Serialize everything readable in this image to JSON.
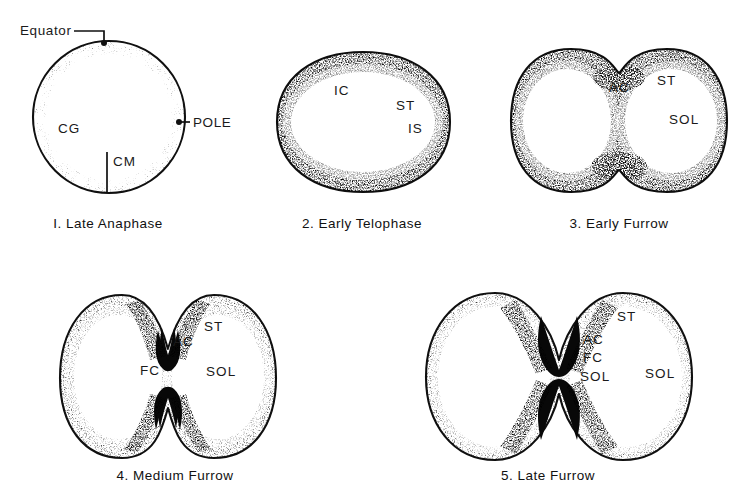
{
  "figure": {
    "background_color": "#ffffff",
    "ink_color": "#101010",
    "stipple_color": "#1a1a1a",
    "panel_count": 5
  },
  "panels": [
    {
      "id": "panel-1",
      "number": "I.",
      "caption": "I. Late  Anaphase",
      "caption_x": 108,
      "caption_y": 228,
      "shape": "circle",
      "labels": [
        {
          "name": "cg",
          "text": "CG",
          "x": 58,
          "y": 133
        },
        {
          "name": "cm",
          "text": "CM",
          "x": 113,
          "y": 166
        }
      ],
      "callouts": [
        {
          "name": "equator",
          "text": "Equator",
          "x": 20,
          "y": 35
        },
        {
          "name": "pole",
          "text": "POLE",
          "x": 193,
          "y": 127
        }
      ]
    },
    {
      "id": "panel-2",
      "number": "2.",
      "caption": "2. Early  Telophase",
      "caption_x": 362,
      "caption_y": 228,
      "shape": "rounded-oval",
      "labels": [
        {
          "name": "ic",
          "text": "IC",
          "x": 334,
          "y": 95
        },
        {
          "name": "st",
          "text": "ST",
          "x": 396,
          "y": 110
        },
        {
          "name": "is",
          "text": "IS",
          "x": 408,
          "y": 133
        }
      ],
      "callouts": []
    },
    {
      "id": "panel-3",
      "number": "3.",
      "caption": "3. Early  Furrow",
      "caption_x": 619,
      "caption_y": 228,
      "shape": "early-furrow",
      "labels": [
        {
          "name": "ac",
          "text": "AC",
          "x": 609,
          "y": 92
        },
        {
          "name": "st",
          "text": "ST",
          "x": 657,
          "y": 85
        },
        {
          "name": "sol",
          "text": "SOL",
          "x": 669,
          "y": 124
        }
      ],
      "callouts": []
    },
    {
      "id": "panel-4",
      "number": "4.",
      "caption": "4. Medium  Furrow",
      "caption_x": 175,
      "caption_y": 480,
      "shape": "medium-furrow",
      "labels": [
        {
          "name": "ac",
          "text": "AC",
          "x": 173,
          "y": 346
        },
        {
          "name": "st",
          "text": "ST",
          "x": 204,
          "y": 331
        },
        {
          "name": "fc",
          "text": "FC",
          "x": 140,
          "y": 375
        },
        {
          "name": "sol",
          "text": "SOL",
          "x": 206,
          "y": 376
        }
      ],
      "callouts": []
    },
    {
      "id": "panel-5",
      "number": "5.",
      "caption": "5. Late  Furrow",
      "caption_x": 548,
      "caption_y": 480,
      "shape": "late-furrow",
      "labels": [
        {
          "name": "st",
          "text": "ST",
          "x": 617,
          "y": 321
        },
        {
          "name": "ac",
          "text": "AC",
          "x": 583,
          "y": 344
        },
        {
          "name": "fc",
          "text": "FC",
          "x": 583,
          "y": 362
        },
        {
          "name": "sol-inner",
          "text": "SOL",
          "x": 580,
          "y": 381
        },
        {
          "name": "sol-outer",
          "text": "SOL",
          "x": 645,
          "y": 378
        }
      ],
      "callouts": []
    }
  ],
  "legend_terms": {
    "CG": "CG",
    "CM": "CM",
    "IC": "IC",
    "IS": "IS",
    "ST": "ST",
    "AC": "AC",
    "FC": "FC",
    "SOL": "SOL",
    "Equator": "Equator",
    "POLE": "POLE"
  }
}
